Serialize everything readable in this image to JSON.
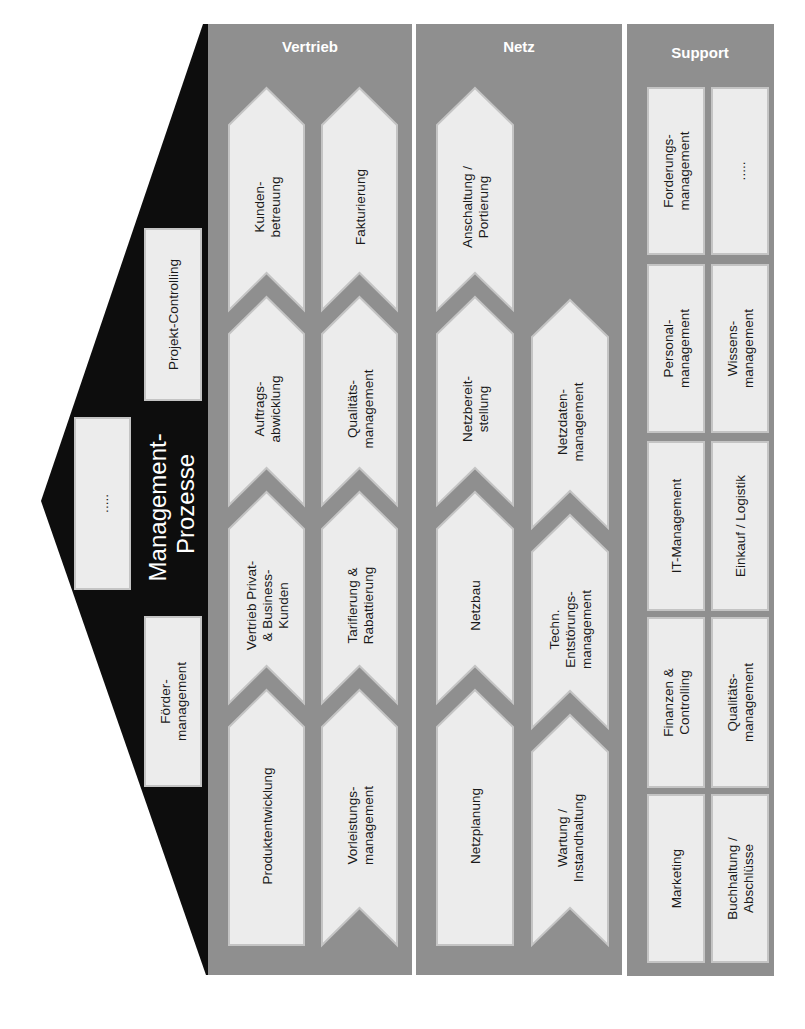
{
  "colors": {
    "panel": "#8f8f8f",
    "box": "#ececec",
    "box_edge": "#c4c4c4",
    "management_shape": "#0d0d0d",
    "header_text": "#ffffff",
    "box_text": "#1a1a1a"
  },
  "management": {
    "title_line1": "Management-",
    "title_line2": "Prozesse",
    "boxes": [
      {
        "id": "foerder",
        "lines": [
          "Förder-",
          "management"
        ]
      },
      {
        "id": "placeholder",
        "lines": [
          "....."
        ]
      },
      {
        "id": "projekt",
        "lines": [
          "Projekt-Controlling"
        ]
      }
    ]
  },
  "vertrieb": {
    "title": "Vertrieb",
    "lanes": [
      {
        "chain": [
          {
            "lines": [
              "Produktentwicklung"
            ]
          },
          {
            "lines": [
              "Vertrieb Privat-",
              "& Business-",
              "Kunden"
            ]
          },
          {
            "lines": [
              "Auftrags-",
              "abwicklung"
            ]
          },
          {
            "lines": [
              "Kunden-",
              "betreuung"
            ]
          }
        ]
      },
      {
        "chain": [
          {
            "lines": [
              "Vorleistungs-",
              "management"
            ]
          },
          {
            "lines": [
              "Tarifierung &",
              "Rabattierung"
            ]
          },
          {
            "lines": [
              "Qualitäts-",
              "management"
            ]
          },
          {
            "lines": [
              "Fakturierung"
            ]
          }
        ]
      }
    ]
  },
  "netz": {
    "title": "Netz",
    "lanes": [
      {
        "chain": [
          {
            "lines": [
              "Netzplanung"
            ]
          },
          {
            "lines": [
              "Netzbau"
            ]
          },
          {
            "lines": [
              "Netzbereit-",
              "stellung"
            ]
          },
          {
            "lines": [
              "Anschaltung /",
              "Portierung"
            ]
          }
        ]
      },
      {
        "chain": [
          {
            "lines": [
              "Wartung /",
              "Instandhaltung"
            ]
          },
          {
            "lines": [
              "Techn.",
              "Entstörungs-",
              "management"
            ]
          },
          {
            "lines": [
              "Netzdaten-",
              "management"
            ]
          }
        ]
      }
    ]
  },
  "support": {
    "title": "Support",
    "columns": [
      [
        "Marketing",
        "Finanzen &\nControlling",
        "IT-Management",
        "Personal-\nmanagement",
        "Forderungs-\nmanagement"
      ],
      [
        "Buchhaltung /\nAbschlüsse",
        "Qualitäts-\nmanagement",
        "Einkauf / Logistik",
        "Wissens-\nmanagement",
        "....."
      ]
    ]
  }
}
